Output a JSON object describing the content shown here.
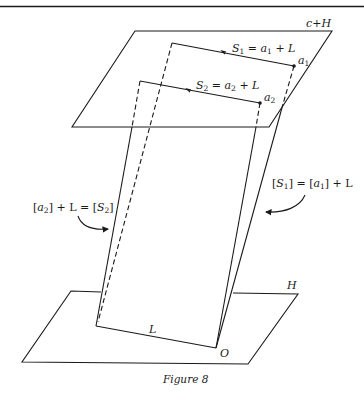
{
  "figure": {
    "caption": "Figure 8",
    "planes": {
      "upper": "c+H",
      "lower": "H"
    },
    "lines": {
      "s1_lhs": "S",
      "s1_lhs_sub": "1",
      "s1_eq": " = ",
      "s1_rhs_a": "a",
      "s1_rhs_a_sub": "1",
      "s1_rhs_tail": " + L",
      "s2_lhs": "S",
      "s2_lhs_sub": "2",
      "s2_eq": " = ",
      "s2_rhs_a": "a",
      "s2_rhs_a_sub": "2",
      "s2_rhs_tail": " + L"
    },
    "points": {
      "a1": "a",
      "a1_sub": "1",
      "a2": "a",
      "a2_sub": "2",
      "origin": "O",
      "line_L": "L"
    },
    "annotations": {
      "right_open": "[",
      "right_S": "S",
      "right_S_sub": "1",
      "right_mid": "] = [",
      "right_a": "a",
      "right_a_sub": "1",
      "right_close": "] + L",
      "left_open": "[",
      "left_a": "a",
      "left_a_sub": "2",
      "left_mid": "] + L = [",
      "left_S": "S",
      "left_S_sub": "2",
      "left_close": "]"
    }
  }
}
